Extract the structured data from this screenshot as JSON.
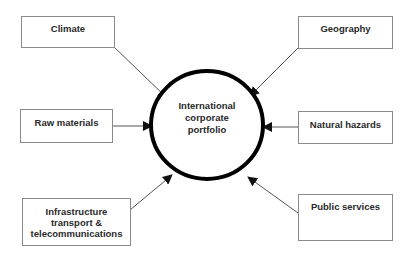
{
  "diagram": {
    "center": {
      "label_lines": [
        "International",
        "corporate",
        "portfolio"
      ]
    },
    "factors": [
      {
        "id": "climate",
        "label_lines": [
          "Climate"
        ]
      },
      {
        "id": "geography",
        "label_lines": [
          "Geography"
        ]
      },
      {
        "id": "raw-materials",
        "label_lines": [
          "Raw materials"
        ]
      },
      {
        "id": "natural-hazards",
        "label_lines": [
          "Natural hazards"
        ]
      },
      {
        "id": "infrastructure",
        "label_lines": [
          "Infrastructure",
          "transport &",
          "telecommunications"
        ]
      },
      {
        "id": "public-services",
        "label_lines": [
          "Public services"
        ]
      }
    ],
    "edges": [
      {
        "from": "climate",
        "to": "center"
      },
      {
        "from": "geography",
        "to": "center"
      },
      {
        "from": "raw-materials",
        "to": "center"
      },
      {
        "from": "natural-hazards",
        "to": "center"
      },
      {
        "from": "infrastructure",
        "to": "center"
      },
      {
        "from": "public-services",
        "to": "center"
      }
    ]
  }
}
